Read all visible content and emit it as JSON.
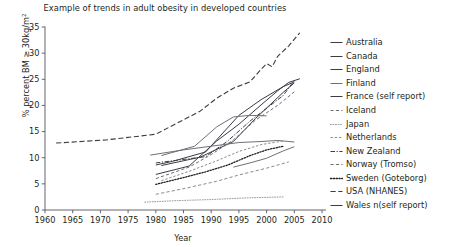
{
  "title": "Example of trends in adult obesity in developed countries",
  "axes": {
    "ylabel_prefix": "% percent BM ≥ 30kg/m",
    "ylabel_sup": "2",
    "xlabel": "Year"
  },
  "legend": {
    "items": [
      {
        "label": "Australia",
        "dash": "solid",
        "color": "#3b3b46",
        "width": 1.0
      },
      {
        "label": "Canada",
        "dash": "solid",
        "color": "#3b3b46",
        "width": 1.0
      },
      {
        "label": "England",
        "dash": "solid",
        "color": "#3b3b46",
        "width": 1.0
      },
      {
        "label": "Finland",
        "dash": "solid",
        "color": "#6f7076",
        "width": 1.0
      },
      {
        "label": "France (self report)",
        "dash": "solid",
        "color": "#3b3b46",
        "width": 1.0
      },
      {
        "label": "Iceland",
        "dash": "dashed",
        "color": "#6f7076",
        "width": 1.0
      },
      {
        "label": "Japan",
        "dash": "dotted",
        "color": "#9a9aa2",
        "width": 1.0
      },
      {
        "label": "Netherlands",
        "dash": "dashed-fine",
        "color": "#8a8a92",
        "width": 1.0
      },
      {
        "label": "New Zealand",
        "dash": "dash-dot",
        "color": "#3b3b46",
        "width": 1.0
      },
      {
        "label": "Norway (Tromso)",
        "dash": "dashed",
        "color": "#6f7076",
        "width": 1.0
      },
      {
        "label": "Sweden (Goteborg)",
        "dash": "dotted-thick",
        "color": "#231f20",
        "width": 1.3
      },
      {
        "label": "USA (NHANES)",
        "dash": "long-dash",
        "color": "#3b3b46",
        "width": 1.1
      },
      {
        "label": "Wales n(self report)",
        "dash": "solid",
        "color": "#3b3b46",
        "width": 1.0
      }
    ]
  },
  "chart_data": {
    "type": "line",
    "title": "Example of trends in adult obesity in developed countries",
    "xlabel": "Year",
    "ylabel": "% percent BM ≥ 30kg/m2",
    "xlim": [
      1960,
      2010
    ],
    "ylim": [
      0,
      35
    ],
    "xticks": [
      1960,
      1965,
      1970,
      1975,
      1980,
      1985,
      1990,
      1995,
      2000,
      2005,
      2010
    ],
    "yticks": [
      0,
      5,
      10,
      15,
      20,
      25,
      30,
      35
    ],
    "grid": false,
    "legend_position": "right",
    "series": [
      {
        "name": "USA (NHANES)",
        "dash": "long-dash",
        "color": "#3b3b46",
        "width": 1.1,
        "points": [
          [
            1962,
            12.8
          ],
          [
            1971,
            13.4
          ],
          [
            1976,
            14.0
          ],
          [
            1980,
            14.5
          ],
          [
            1988,
            18.9
          ],
          [
            1991,
            21.4
          ],
          [
            1994,
            23.3
          ],
          [
            1997,
            24.5
          ],
          [
            1999,
            26.9
          ],
          [
            2000,
            28.0
          ],
          [
            2001,
            27.4
          ],
          [
            2002,
            29.4
          ],
          [
            2004,
            31.4
          ],
          [
            2006,
            33.9
          ]
        ]
      },
      {
        "name": "England",
        "dash": "solid",
        "color": "#3b3b46",
        "width": 1.0,
        "points": [
          [
            1980,
            6.8
          ],
          [
            1986,
            8.4
          ],
          [
            1991,
            13.2
          ],
          [
            1995,
            16.4
          ],
          [
            1999,
            20.1
          ],
          [
            2002,
            22.8
          ],
          [
            2004,
            24.4
          ],
          [
            2006,
            25.1
          ]
        ]
      },
      {
        "name": "New Zealand",
        "dash": "dash-dot",
        "color": "#3b3b46",
        "width": 1.0,
        "points": [
          [
            1980,
            9.0
          ],
          [
            1989,
            10.2
          ],
          [
            1993,
            13.2
          ],
          [
            1997,
            17.0
          ],
          [
            2003,
            21.9
          ],
          [
            2005,
            24.8
          ]
        ]
      },
      {
        "name": "Australia",
        "dash": "solid",
        "color": "#3b3b46",
        "width": 1.0,
        "points": [
          [
            1980,
            8.6
          ],
          [
            1983,
            9.3
          ],
          [
            1989,
            11.1
          ],
          [
            1995,
            18.1
          ],
          [
            1999,
            21.1
          ],
          [
            2003,
            23.6
          ],
          [
            2005,
            24.5
          ]
        ]
      },
      {
        "name": "Canada",
        "dash": "solid",
        "color": "#3b3b46",
        "width": 1.0,
        "points": [
          [
            1981,
            8.5
          ],
          [
            1988,
            10.1
          ],
          [
            1994,
            13.1
          ],
          [
            1998,
            17.5
          ],
          [
            2003,
            22.5
          ],
          [
            2005,
            24.3
          ]
        ]
      },
      {
        "name": "Iceland",
        "dash": "dashed",
        "color": "#6f7076",
        "width": 1.0,
        "points": [
          [
            1980,
            6.0
          ],
          [
            1986,
            8.2
          ],
          [
            1990,
            10.6
          ],
          [
            1994,
            13.4
          ],
          [
            1998,
            17.2
          ],
          [
            2002,
            20.0
          ],
          [
            2005,
            22.6
          ]
        ]
      },
      {
        "name": "Finland",
        "dash": "solid",
        "color": "#6f7076",
        "width": 1.0,
        "points": [
          [
            1979,
            10.5
          ],
          [
            1985,
            11.5
          ],
          [
            1990,
            12.2
          ],
          [
            1995,
            12.9
          ],
          [
            1999,
            13.1
          ],
          [
            2002,
            13.3
          ],
          [
            2005,
            13.0
          ]
        ]
      },
      {
        "name": "Netherlands",
        "dash": "dashed-fine",
        "color": "#8a8a92",
        "width": 1.0,
        "points": [
          [
            1981,
            5.6
          ],
          [
            1986,
            7.4
          ],
          [
            1991,
            9.4
          ],
          [
            1995,
            11.2
          ],
          [
            1999,
            12.5
          ],
          [
            2003,
            13.2
          ]
        ]
      },
      {
        "name": "France (self report)",
        "dash": "solid",
        "color": "#6f7076",
        "width": 1.0,
        "points": [
          [
            1981,
            10.4
          ],
          [
            1987,
            12.2
          ],
          [
            1991,
            15.9
          ],
          [
            1994,
            17.8
          ],
          [
            1997,
            18.1
          ],
          [
            2000,
            18.0
          ]
        ]
      },
      {
        "name": "Wales n(self report)",
        "dash": "solid",
        "color": "#6f7076",
        "width": 1.0,
        "points": [
          [
            1994,
            8.2
          ],
          [
            1997,
            9.0
          ],
          [
            2000,
            9.9
          ],
          [
            2003,
            11.3
          ],
          [
            2005,
            12.1
          ]
        ]
      },
      {
        "name": "Sweden (Goteborg)",
        "dash": "dotted-thick",
        "color": "#231f20",
        "width": 1.3,
        "points": [
          [
            1980,
            4.9
          ],
          [
            1985,
            6.2
          ],
          [
            1989,
            7.3
          ],
          [
            1993,
            8.6
          ],
          [
            1997,
            10.4
          ],
          [
            2000,
            11.5
          ],
          [
            2003,
            12.2
          ]
        ]
      },
      {
        "name": "Norway (Tromso)",
        "dash": "dashed",
        "color": "#8a8a92",
        "width": 1.0,
        "points": [
          [
            1980,
            3.0
          ],
          [
            1986,
            4.3
          ],
          [
            1991,
            5.5
          ],
          [
            1995,
            6.7
          ],
          [
            2000,
            8.0
          ],
          [
            2004,
            9.2
          ]
        ]
      },
      {
        "name": "Japan",
        "dash": "dotted",
        "color": "#9a9aa2",
        "width": 1.0,
        "points": [
          [
            1978,
            1.5
          ],
          [
            1984,
            1.8
          ],
          [
            1990,
            2.0
          ],
          [
            1996,
            2.3
          ],
          [
            2003,
            2.5
          ]
        ]
      }
    ]
  }
}
